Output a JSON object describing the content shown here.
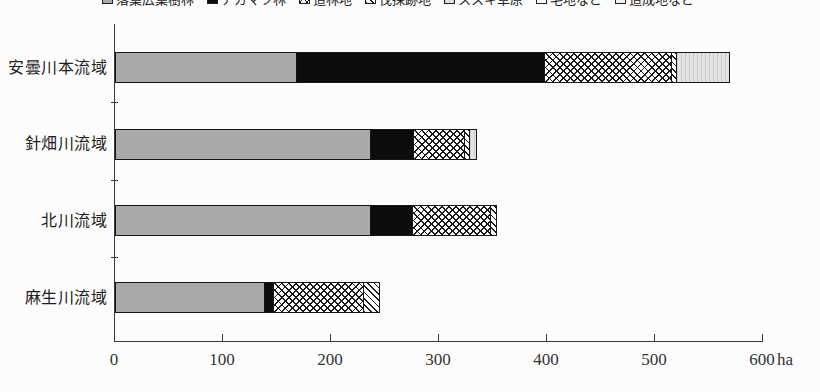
{
  "chart_data": {
    "type": "bar",
    "orientation": "horizontal",
    "title": "",
    "unit": "ha",
    "categories": [
      "安曇川本流域",
      "針畑川流域",
      "北川流域",
      "麻生川流域"
    ],
    "series": [
      {
        "name": "落葉広葉樹林",
        "pattern": "gray",
        "values": [
          168,
          236,
          236,
          138
        ]
      },
      {
        "name": "アカマツ林",
        "pattern": "black",
        "values": [
          229,
          40,
          39,
          8
        ]
      },
      {
        "name": "造林地",
        "pattern": "crosshatch",
        "values": [
          118,
          47,
          72,
          84
        ]
      },
      {
        "name": "伐採跡地",
        "pattern": "diagonal",
        "values": [
          5,
          5,
          5,
          14
        ]
      },
      {
        "name": "ススキ草原",
        "pattern": "lightgray",
        "values": [
          48,
          5,
          0,
          0
        ]
      },
      {
        "name": "宅地など",
        "pattern": "white",
        "values": [
          0,
          0,
          0,
          0
        ]
      },
      {
        "name": "造成地など",
        "pattern": "dotted",
        "values": [
          0,
          0,
          0,
          0
        ]
      }
    ],
    "totals": [
      568,
      333,
      352,
      244
    ],
    "x_ticks": [
      "0",
      "100",
      "200",
      "300",
      "400",
      "500",
      "600"
    ],
    "x_unit_label": "ha",
    "xlim": [
      0,
      600
    ],
    "grid": false,
    "legend_position": "top, clipped at upper image edge"
  }
}
